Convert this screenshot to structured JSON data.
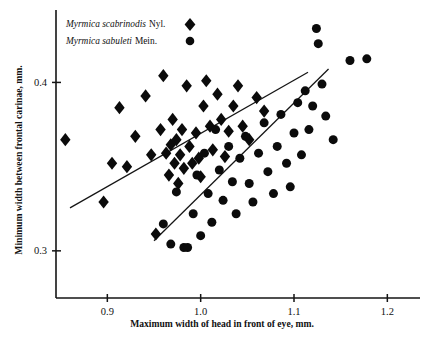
{
  "figure": {
    "background": "#ffffff",
    "ink": "#111111"
  },
  "legend": {
    "position": "top-left",
    "entries": [
      {
        "species_italic": "Myrmica scabrinodis",
        "authority": "Nyl.",
        "marker": "diamond",
        "label": "Myrmica scabrinodis Nyl."
      },
      {
        "species_italic": "Myrmica sabuleti",
        "authority": "Mein.",
        "marker": "circle",
        "label": "Myrmica sabuleti Mein."
      }
    ]
  },
  "chart_data": {
    "type": "scatter",
    "title": "",
    "xlabel": "Maximum width of head in front of eye, mm.",
    "ylabel": "Minimum width between frontal carinae, mm.",
    "xlim": [
      0.845,
      1.235
    ],
    "ylim": [
      0.272,
      0.443
    ],
    "xticks": [
      0.9,
      1.0,
      1.1,
      1.2
    ],
    "xticklabels": [
      "0.9",
      "1.0",
      "1.1",
      "1.2"
    ],
    "yticks": [
      0.3,
      0.4
    ],
    "yticklabels": [
      "0.3",
      "0.4"
    ],
    "grid": false,
    "legend_position": "top-left",
    "series": [
      {
        "name": "Myrmica scabrinodis Nyl.",
        "marker": "diamond",
        "color": "#0b0b0b",
        "points": [
          [
            0.855,
            0.366
          ],
          [
            0.896,
            0.329
          ],
          [
            0.905,
            0.352
          ],
          [
            0.913,
            0.385
          ],
          [
            0.921,
            0.35
          ],
          [
            0.93,
            0.368
          ],
          [
            0.941,
            0.392
          ],
          [
            0.947,
            0.357
          ],
          [
            0.952,
            0.31
          ],
          [
            0.957,
            0.372
          ],
          [
            0.96,
            0.404
          ],
          [
            0.963,
            0.358
          ],
          [
            0.966,
            0.345
          ],
          [
            0.968,
            0.363
          ],
          [
            0.97,
            0.378
          ],
          [
            0.972,
            0.352
          ],
          [
            0.974,
            0.366
          ],
          [
            0.976,
            0.34
          ],
          [
            0.978,
            0.357
          ],
          [
            0.98,
            0.372
          ],
          [
            0.982,
            0.349
          ],
          [
            0.985,
            0.398
          ],
          [
            0.988,
            0.362
          ],
          [
            0.991,
            0.352
          ],
          [
            0.995,
            0.37
          ],
          [
            0.998,
            0.355
          ],
          [
            1.0,
            0.344
          ],
          [
            1.003,
            0.386
          ],
          [
            1.006,
            0.401
          ],
          [
            1.01,
            0.374
          ],
          [
            1.013,
            0.36
          ],
          [
            1.018,
            0.393
          ],
          [
            1.022,
            0.378
          ],
          [
            1.026,
            0.356
          ],
          [
            1.03,
            0.371
          ],
          [
            1.035,
            0.386
          ],
          [
            1.04,
            0.398
          ],
          [
            1.045,
            0.374
          ],
          [
            1.052,
            0.366
          ],
          [
            1.06,
            0.391
          ],
          [
            1.068,
            0.383
          ]
        ]
      },
      {
        "name": "Myrmica sabuleti Mein.",
        "marker": "circle",
        "color": "#0b0b0b",
        "points": [
          [
            0.96,
            0.316
          ],
          [
            0.968,
            0.304
          ],
          [
            0.974,
            0.335
          ],
          [
            0.982,
            0.302
          ],
          [
            0.986,
            0.302
          ],
          [
            0.992,
            0.322
          ],
          [
            0.996,
            0.345
          ],
          [
            1.0,
            0.309
          ],
          [
            1.004,
            0.358
          ],
          [
            1.008,
            0.334
          ],
          [
            1.012,
            0.317
          ],
          [
            1.016,
            0.372
          ],
          [
            1.02,
            0.348
          ],
          [
            1.024,
            0.33
          ],
          [
            1.03,
            0.362
          ],
          [
            1.034,
            0.341
          ],
          [
            1.038,
            0.322
          ],
          [
            1.042,
            0.355
          ],
          [
            1.048,
            0.368
          ],
          [
            1.052,
            0.34
          ],
          [
            1.056,
            0.329
          ],
          [
            1.062,
            0.358
          ],
          [
            1.068,
            0.376
          ],
          [
            1.072,
            0.347
          ],
          [
            1.078,
            0.334
          ],
          [
            1.082,
            0.362
          ],
          [
            1.086,
            0.381
          ],
          [
            1.092,
            0.352
          ],
          [
            1.096,
            0.338
          ],
          [
            1.1,
            0.37
          ],
          [
            1.104,
            0.388
          ],
          [
            1.108,
            0.357
          ],
          [
            1.112,
            0.395
          ],
          [
            1.116,
            0.372
          ],
          [
            1.12,
            0.386
          ],
          [
            1.124,
            0.432
          ],
          [
            1.126,
            0.423
          ],
          [
            1.13,
            0.399
          ],
          [
            1.134,
            0.38
          ],
          [
            1.142,
            0.366
          ],
          [
            1.16,
            0.413
          ],
          [
            1.178,
            0.414
          ]
        ]
      }
    ],
    "fit_lines": [
      {
        "name": "scabrinodis-regression",
        "x": [
          0.86,
          1.115
        ],
        "y": [
          0.3255,
          0.406
        ]
      },
      {
        "name": "sabuleti-regression",
        "x": [
          0.95,
          1.137
        ],
        "y": [
          0.306,
          0.408
        ]
      }
    ]
  }
}
